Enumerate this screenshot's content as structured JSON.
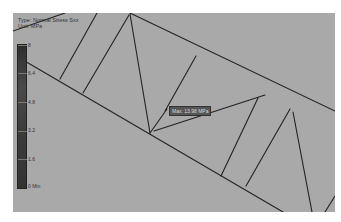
{
  "header": {
    "type_line": "Type: Normal Stress Sxx",
    "unit_line": "Unit: MPa"
  },
  "legend": {
    "labels": [
      "8",
      "6.4",
      "4.8",
      "3.2",
      "1.6",
      "0 Min"
    ],
    "gradient_top": "#2e2e2e",
    "gradient_bottom": "#333333"
  },
  "probe": {
    "max_label": "Max: 13.98 MPa"
  },
  "colors": {
    "viewport_bg": "#a9a9a9",
    "member_stroke": "#222222"
  }
}
